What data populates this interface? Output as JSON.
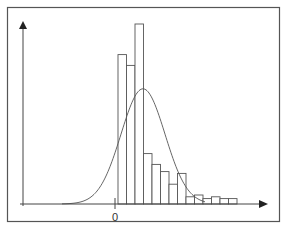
{
  "chart_data": {
    "type": "bar",
    "subtype": "histogram-with-density-curve",
    "title": "",
    "xlabel": "",
    "ylabel": "",
    "x_tick_labels": [
      "0"
    ],
    "grid": false,
    "legend": null,
    "bins": [
      {
        "index": 1,
        "value": 83
      },
      {
        "index": 2,
        "value": 77
      },
      {
        "index": 3,
        "value": 100
      },
      {
        "index": 4,
        "value": 28
      },
      {
        "index": 5,
        "value": 22
      },
      {
        "index": 6,
        "value": 18
      },
      {
        "index": 7,
        "value": 11
      },
      {
        "index": 8,
        "value": 17
      },
      {
        "index": 9,
        "value": 4
      },
      {
        "index": 10,
        "value": 5
      },
      {
        "index": 11,
        "value": 3
      },
      {
        "index": 12,
        "value": 4
      },
      {
        "index": 13,
        "value": 3
      },
      {
        "index": 14,
        "value": 3
      }
    ],
    "values": [
      83,
      77,
      100,
      28,
      22,
      18,
      11,
      17,
      4,
      5,
      3,
      4,
      3,
      3
    ],
    "ylim": [
      0,
      100
    ],
    "overlay": {
      "type": "line",
      "description": "normal density curve",
      "peak_relative_height": 64,
      "peak_bin_position": 3
    }
  },
  "axes": {
    "zero_label": "0"
  },
  "colors": {
    "background": "#ffffff",
    "frame": "#555555",
    "axis": "#444444",
    "bar_stroke": "#555555",
    "bar_fill": "#ffffff",
    "curve": "#555555"
  }
}
